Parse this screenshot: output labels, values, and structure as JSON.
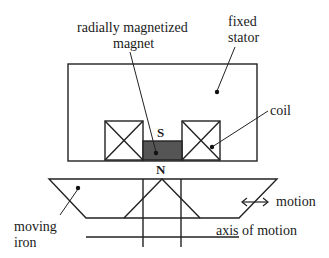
{
  "diagram": {
    "labels": {
      "magnet_line1": "radially magnetized",
      "magnet_line2": "magnet",
      "stator_line1": "fixed",
      "stator_line2": "stator",
      "coil": "coil",
      "pole_south": "S",
      "pole_north": "N",
      "motion": "motion",
      "axis": "axis of motion",
      "iron_line1": "moving",
      "iron_line2": "iron"
    },
    "colors": {
      "line": "#222222",
      "magnet_fill": "#555555",
      "background": "#ffffff"
    }
  }
}
